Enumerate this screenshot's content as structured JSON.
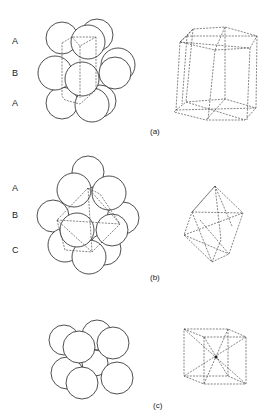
{
  "panels": [
    {
      "caption": "(a)",
      "layers": [
        "A",
        "B",
        "A"
      ],
      "structure": "hexagonal close-packed"
    },
    {
      "caption": "(b)",
      "layers": [
        "A",
        "B",
        "C"
      ],
      "structure": "cubic close-packed"
    },
    {
      "caption": "(c)",
      "layers": [],
      "structure": "body-centred cubic"
    }
  ]
}
